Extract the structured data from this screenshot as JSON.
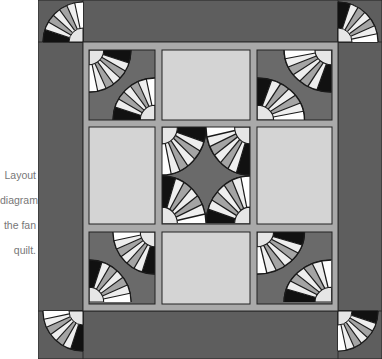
{
  "caption": {
    "lines": [
      "Layout",
      "diagram",
      "the fan",
      "quilt."
    ],
    "full_text": "Layout diagram for the fan quilt."
  },
  "colors": {
    "border": "#5e5e5e",
    "sashing": "#a9a9a9",
    "plain_block": "#d4d4d4",
    "fan_background": "#6a6a6a",
    "blade_light": "#eeeeee",
    "blade_mid": "#a4a4a4",
    "blade_dark": "#111111",
    "outline": "#1a1a1a"
  },
  "layout": {
    "grid": "3x3 blocks with sashing and wide outer border",
    "corner_fans": 4,
    "fan_blocks": 5,
    "plain_blocks": 4
  }
}
